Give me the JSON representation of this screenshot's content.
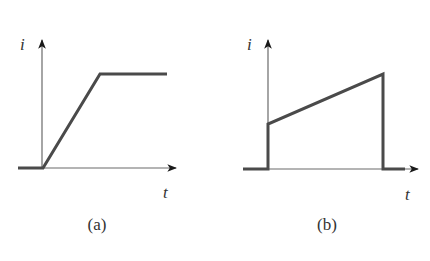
{
  "diagrams": [
    {
      "caption": "(a)",
      "y_label": "i",
      "x_label": "t",
      "description": "Current is zero, then ramps linearly up to a constant value and stays flat",
      "waveform": "ramp-then-constant"
    },
    {
      "caption": "(b)",
      "y_label": "i",
      "x_label": "t",
      "description": "Current steps up from zero, ramps linearly upward, then drops abruptly back to zero",
      "waveform": "step-ramp-drop"
    }
  ],
  "colors": {
    "waveform": "#4a4a4a",
    "axis": "#6a6a6a",
    "text": "#333333"
  }
}
